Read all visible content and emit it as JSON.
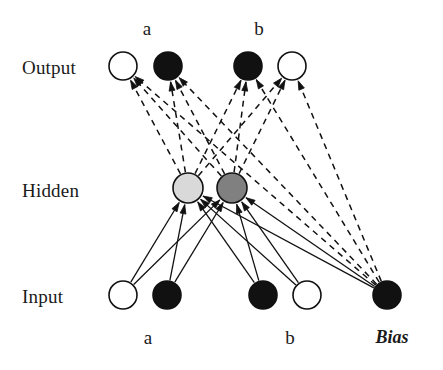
{
  "diagram": {
    "type": "neural-network",
    "title": "",
    "layers": [
      {
        "id": "output",
        "label": "Output",
        "label_x": 22,
        "label_y": 57,
        "y": 66,
        "nodes": [
          {
            "id": "out-1",
            "x": 123,
            "r": 14,
            "fill": "#ffffff",
            "stroke": "#111111",
            "top_label": "",
            "state": "white"
          },
          {
            "id": "out-2",
            "x": 168,
            "r": 14,
            "fill": "#111111",
            "stroke": "#111111",
            "top_label": "a",
            "state": "black"
          },
          {
            "id": "out-3",
            "x": 248,
            "r": 14,
            "fill": "#111111",
            "stroke": "#111111",
            "top_label": "b",
            "state": "black"
          },
          {
            "id": "out-4",
            "x": 292,
            "r": 14,
            "fill": "#ffffff",
            "stroke": "#111111",
            "top_label": "",
            "state": "white"
          }
        ]
      },
      {
        "id": "hidden",
        "label": "Hidden",
        "label_x": 22,
        "label_y": 180,
        "y": 188,
        "nodes": [
          {
            "id": "hid-1",
            "x": 188,
            "r": 15,
            "fill": "#d9d9d9",
            "stroke": "#111111",
            "top_label": "",
            "state": "light-gray"
          },
          {
            "id": "hid-2",
            "x": 232,
            "r": 15,
            "fill": "#808080",
            "stroke": "#111111",
            "top_label": "",
            "state": "dark-gray"
          }
        ]
      },
      {
        "id": "input",
        "label": "Input",
        "label_x": 22,
        "label_y": 286,
        "y": 295,
        "nodes": [
          {
            "id": "in-1",
            "x": 123,
            "r": 14,
            "fill": "#ffffff",
            "stroke": "#111111",
            "bottom_label": "",
            "state": "white"
          },
          {
            "id": "in-2",
            "x": 167,
            "r": 14,
            "fill": "#111111",
            "stroke": "#111111",
            "bottom_label": "a",
            "state": "black"
          },
          {
            "id": "in-3",
            "x": 263,
            "r": 14,
            "fill": "#111111",
            "stroke": "#111111",
            "bottom_label": "",
            "state": "black"
          },
          {
            "id": "in-4",
            "x": 307,
            "r": 14,
            "fill": "#ffffff",
            "stroke": "#111111",
            "bottom_label": "b",
            "state": "white"
          },
          {
            "id": "in-5",
            "x": 387,
            "r": 14,
            "fill": "#111111",
            "stroke": "#111111",
            "bottom_label": "Bias",
            "state": "black"
          }
        ]
      }
    ],
    "top_labels": [
      {
        "text": "a",
        "x": 147,
        "y": 18
      },
      {
        "text": "b",
        "x": 259,
        "y": 18
      }
    ],
    "bottom_labels": [
      {
        "text": "a",
        "x": 148,
        "y": 327
      },
      {
        "text": "b",
        "x": 290,
        "y": 327
      },
      {
        "text": "Bias",
        "x": 392,
        "y": 327,
        "style": "italic"
      }
    ],
    "edges": {
      "input_to_hidden": {
        "style": "solid",
        "color": "#111111",
        "width": 1.3,
        "arrowhead": true,
        "from": [
          "in-1",
          "in-2",
          "in-3",
          "in-4",
          "in-5"
        ],
        "to": [
          "hid-1",
          "hid-2"
        ]
      },
      "hidden_to_output": {
        "style": "dashed",
        "color": "#111111",
        "width": 1.5,
        "dash": "6,5",
        "arrowhead": true,
        "from": [
          "hid-1",
          "hid-2",
          "in-5"
        ],
        "to": [
          "out-1",
          "out-2",
          "out-3",
          "out-4"
        ]
      }
    },
    "colors": {
      "ink": "#111111",
      "background": "#ffffff",
      "hidden_light": "#d9d9d9",
      "hidden_dark": "#808080"
    }
  }
}
